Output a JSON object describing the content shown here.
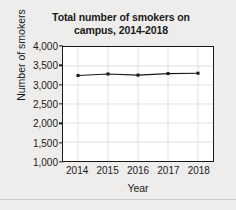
{
  "chart_data": {
    "type": "line",
    "title": "Total number of smokers on campus, 2014-2018",
    "title_lines": [
      "Total number of smokers on",
      "campus, 2014-2018"
    ],
    "xlabel": "Year",
    "ylabel": "Number of smokers",
    "categories": [
      "2014",
      "2015",
      "2016",
      "2017",
      "2018"
    ],
    "x": [
      2014,
      2015,
      2016,
      2017,
      2018
    ],
    "values": [
      3250,
      3290,
      3260,
      3300,
      3310
    ],
    "series": [
      {
        "name": "Total number of smokers",
        "values": [
          3250,
          3290,
          3260,
          3300,
          3310
        ]
      }
    ],
    "ylim": [
      1000,
      4000
    ],
    "y_ticks": [
      1000,
      1500,
      2000,
      2500,
      3000,
      3500,
      4000
    ],
    "y_tick_labels": [
      "1,000",
      "1,500",
      "2,000",
      "2,500",
      "3,000",
      "3,500",
      "4,000"
    ],
    "x_tick_labels": [
      "2014",
      "2015",
      "2016",
      "2017",
      "2018"
    ],
    "grid": true,
    "grid_color": "#d8d8d8",
    "legend": false,
    "legend_position": "none",
    "line_color": "#1a1a1a",
    "marker": "square",
    "marker_color": "#1a1a1a",
    "plot_background": "#ffffff",
    "figure_background": "#eeedec",
    "axis_color": "#1a1a1a"
  }
}
